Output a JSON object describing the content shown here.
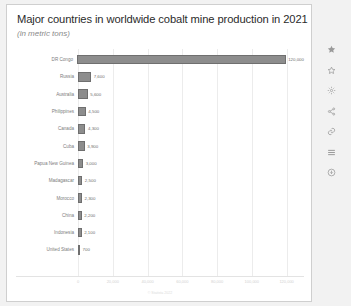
{
  "card": {
    "title": "Major countries in worldwide cobalt mine production in 2021",
    "subtitle": "(in metric tons)",
    "source": "© Statista 2022"
  },
  "chart_data": {
    "type": "bar",
    "orientation": "horizontal",
    "title": "Major countries in worldwide cobalt mine production in 2021",
    "subtitle": "(in metric tons)",
    "xlabel": "",
    "ylabel": "",
    "xlim": [
      0,
      130000
    ],
    "grid": true,
    "legend": null,
    "bar_color": "#8d8d8d",
    "categories": [
      "DR Congo",
      "Russia",
      "Australia",
      "Philippines",
      "Canada",
      "Cuba",
      "Papua New Guinea",
      "Madagascar",
      "Morocco",
      "China",
      "Indonesia",
      "United States"
    ],
    "values": [
      120000,
      7600,
      5600,
      4500,
      4300,
      3900,
      3000,
      2500,
      2300,
      2200,
      2100,
      700
    ],
    "value_labels": [
      "120,000",
      "7,600",
      "5,600",
      "4,500",
      "4,300",
      "3,900",
      "3,000",
      "2,500",
      "2,300",
      "2,200",
      "2,100",
      "700"
    ],
    "xticks": [
      0,
      20000,
      40000,
      60000,
      80000,
      100000,
      120000
    ],
    "xticklabels": [
      "0",
      "20,000",
      "40,000",
      "60,000",
      "80,000",
      "100,000",
      "120,000"
    ]
  },
  "toolbar": {
    "items": [
      {
        "icon": "star-icon",
        "label": "Favorite"
      },
      {
        "icon": "star-outline-icon",
        "label": "Bookmark"
      },
      {
        "icon": "gear-icon",
        "label": "Settings"
      },
      {
        "icon": "share-icon",
        "label": "Share"
      },
      {
        "icon": "link-icon",
        "label": "Link"
      },
      {
        "icon": "list-icon",
        "label": "List view"
      },
      {
        "icon": "download-icon",
        "label": "Download"
      }
    ]
  }
}
